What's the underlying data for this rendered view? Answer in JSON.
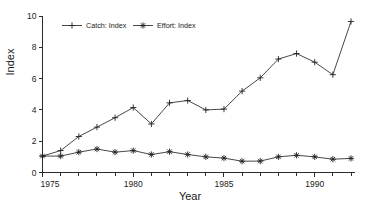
{
  "chart_data": {
    "type": "line",
    "title": "",
    "xlabel": "Year",
    "ylabel": "Index",
    "xlim": [
      1975,
      1992
    ],
    "ylim": [
      0,
      10
    ],
    "grid": false,
    "legend_position": "top-left-inside",
    "x": [
      1975,
      1976,
      1977,
      1978,
      1979,
      1980,
      1981,
      1982,
      1983,
      1984,
      1985,
      1986,
      1987,
      1988,
      1989,
      1990,
      1991,
      1992
    ],
    "xticks_major": [
      1975,
      1980,
      1985,
      1990
    ],
    "xticklabels": [
      "1975",
      "1980",
      "1985",
      "1990"
    ],
    "xticks_minor": [
      1976,
      1977,
      1978,
      1979,
      1981,
      1982,
      1983,
      1984,
      1986,
      1987,
      1988,
      1989,
      1991,
      1992
    ],
    "yticks": [
      0,
      2,
      4,
      6,
      8,
      10
    ],
    "yticklabels": [
      "0",
      "2",
      "4",
      "6",
      "8",
      "10"
    ],
    "series": [
      {
        "name": "Catch: Index",
        "marker": "plus",
        "values": [
          1.05,
          1.4,
          2.3,
          2.9,
          3.5,
          4.15,
          3.1,
          4.45,
          4.6,
          4.0,
          4.05,
          5.2,
          6.05,
          7.25,
          7.6,
          7.05,
          6.25,
          9.65
        ]
      },
      {
        "name": "Effort: Index",
        "marker": "asterisk",
        "values": [
          1.05,
          1.05,
          1.3,
          1.5,
          1.3,
          1.4,
          1.15,
          1.33,
          1.15,
          1.0,
          0.92,
          0.72,
          0.73,
          1.0,
          1.1,
          1.0,
          0.85,
          0.9
        ]
      }
    ],
    "colors": {
      "axis": "#2b2b2b",
      "catch_line": "#333333",
      "effort_line": "#333333",
      "background": "#ffffff"
    }
  },
  "legend": {
    "items": [
      {
        "label": "Catch: Index",
        "marker": "plus"
      },
      {
        "label": "Effort: Index",
        "marker": "asterisk"
      }
    ]
  },
  "axes": {
    "y_title": "Index",
    "x_title": "Year"
  }
}
